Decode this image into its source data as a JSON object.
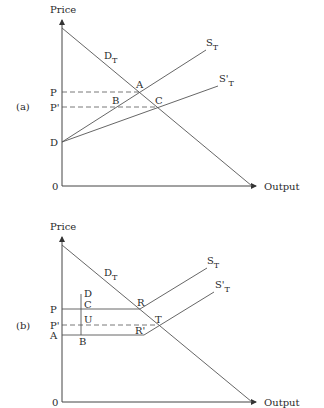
{
  "panels": [
    {
      "id": "a",
      "panel_label": "(a)",
      "y_axis_label": "Price",
      "x_axis_label": "Output",
      "origin_label": "0",
      "price_labels": {
        "P": "P",
        "P_prime": "P'",
        "D": "D"
      },
      "point_labels": {
        "A": "A",
        "B": "B",
        "C": "C"
      },
      "curve_labels": {
        "demand": {
          "main": "D",
          "sub": "T"
        },
        "supply": {
          "main": "S",
          "sub": "T"
        },
        "supply_prime": {
          "main": "S'",
          "sub": "T"
        }
      }
    },
    {
      "id": "b",
      "panel_label": "(b)",
      "y_axis_label": "Price",
      "x_axis_label": "Output",
      "origin_label": "0",
      "price_labels": {
        "P": "P",
        "P_prime": "P'",
        "A": "A"
      },
      "point_labels": {
        "D": "D",
        "C": "C",
        "U": "U",
        "B": "B",
        "R": "R",
        "T": "T",
        "R_prime": "R'"
      },
      "curve_labels": {
        "demand": {
          "main": "D",
          "sub": "T"
        },
        "supply": {
          "main": "S",
          "sub": "T"
        },
        "supply_prime": {
          "main": "S'",
          "sub": "T"
        }
      }
    }
  ]
}
